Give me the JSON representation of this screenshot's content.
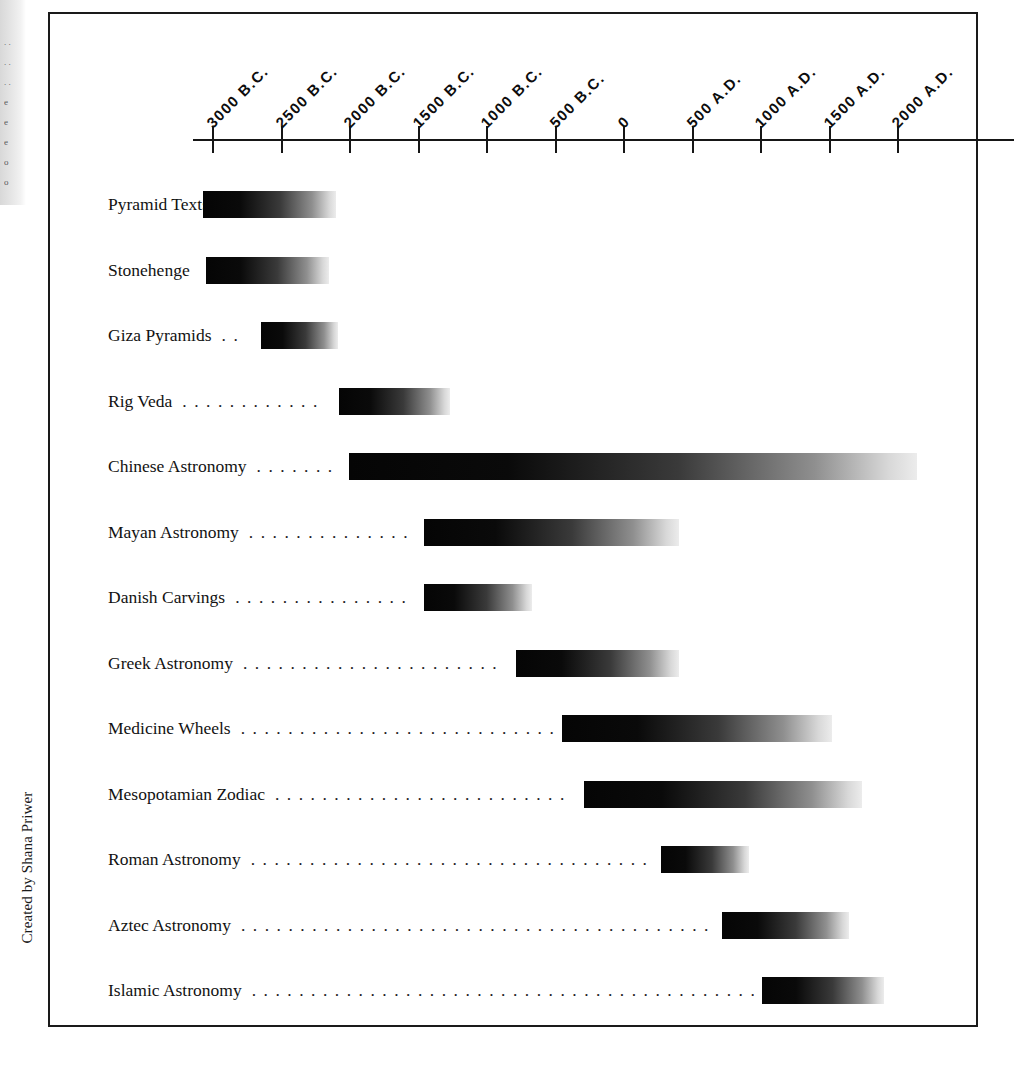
{
  "figure": {
    "credit": "Created by Shana Priwer",
    "background_color": "#ffffff",
    "frame_color": "#1a1a1a",
    "bar_gradient": "black-to-white left-to-right"
  },
  "scan_artifact": {
    "fragments": [
      ". .",
      ". .",
      ". .",
      "e",
      "e",
      "e",
      "o",
      "o"
    ]
  },
  "chart_data": {
    "type": "bar",
    "orientation": "horizontal",
    "subtype": "timeline-gantt",
    "title": "",
    "subtitle": "",
    "xlabel": "",
    "ylabel": "",
    "grid": false,
    "legend": null,
    "xlim": [
      -3250,
      2150
    ],
    "x_tick_values": [
      -3000,
      -2500,
      -2000,
      -1500,
      -1000,
      -500,
      0,
      500,
      1000,
      1500,
      2000
    ],
    "x_tick_labels": [
      "3000 B.C.",
      "2500 B.C.",
      "2000 B.C.",
      "1500 B.C.",
      "1000 B.C.",
      "500 B.C.",
      "0",
      "500 A.D.",
      "1000 A.D.",
      "1500 A.D.",
      "2000 A.D."
    ],
    "categories": [
      "Pyramid Texts",
      "Stonehenge",
      "Giza Pyramids",
      "Rig Veda",
      "Chinese Astronomy",
      "Mayan Astronomy",
      "Danish Carvings",
      "Greek Astronomy",
      "Medicine Wheels",
      "Mesopotamian Zodiac",
      "Roman Astronomy",
      "Aztec Astronomy",
      "Islamic Astronomy"
    ],
    "spans": [
      {
        "label": "Pyramid Texts",
        "start": -3070,
        "end": -2100,
        "start_label": "3070 B.C.",
        "end_label": "2100 B.C."
      },
      {
        "label": "Stonehenge",
        "start": -3050,
        "end": -2150,
        "start_label": "3050 B.C.",
        "end_label": "2150 B.C."
      },
      {
        "label": "Giza Pyramids",
        "start": -2650,
        "end": -2090,
        "start_label": "2650 B.C.",
        "end_label": "2090 B.C."
      },
      {
        "label": "Rig Veda",
        "start": -2080,
        "end": -1270,
        "start_label": "2080 B.C.",
        "end_label": "1270 B.C."
      },
      {
        "label": "Chinese Astronomy",
        "start": -2010,
        "end": 2140,
        "start_label": "2010 B.C.",
        "end_label": "2140 A.D."
      },
      {
        "label": "Mayan Astronomy",
        "start": -1460,
        "end": 400,
        "start_label": "1460 B.C.",
        "end_label": "400 A.D."
      },
      {
        "label": "Danish Carvings",
        "start": -1460,
        "end": -670,
        "start_label": "1460 B.C.",
        "end_label": "670 B.C."
      },
      {
        "label": "Greek Astronomy",
        "start": -790,
        "end": 400,
        "start_label": "790 B.C.",
        "end_label": "400 A.D."
      },
      {
        "label": "Medicine Wheels",
        "start": -450,
        "end": 1520,
        "start_label": "450 B.C.",
        "end_label": "1520 A.D."
      },
      {
        "label": "Mesopotamian Zodiac",
        "start": -290,
        "end": 1740,
        "start_label": "290 B.C.",
        "end_label": "1740 A.D."
      },
      {
        "label": "Roman Astronomy",
        "start": 270,
        "end": 910,
        "start_label": "270 A.D.",
        "end_label": "910 A.D."
      },
      {
        "label": "Aztec Astronomy",
        "start": 715,
        "end": 1640,
        "start_label": "715 A.D.",
        "end_label": "1640 A.D."
      },
      {
        "label": "Islamic Astronomy",
        "start": 1010,
        "end": 1900,
        "start_label": "1010 A.D.",
        "end_label": "1900 A.D."
      }
    ]
  }
}
